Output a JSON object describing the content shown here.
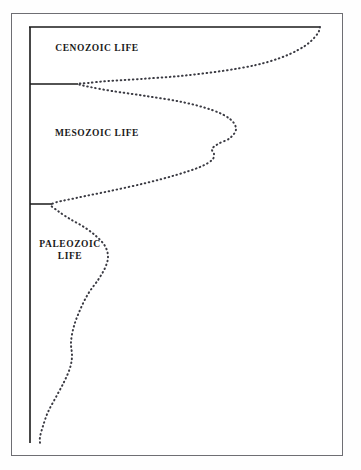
{
  "figure": {
    "title": "",
    "background_color": "#ffffff",
    "frame_color": "#6e6e73",
    "axis_color": "#1a1a1a",
    "curve_color": "#3a3a42",
    "curve_style": "dotted"
  },
  "labels": {
    "cenozoic": "CENOZOIC LIFE",
    "mesozoic": "MESOZOIC LIFE",
    "paleozoic": "PALEOZOIC\nLIFE"
  },
  "chart_data": {
    "type": "area",
    "title": "",
    "subtitle": "",
    "xlabel": "",
    "ylabel": "",
    "grid": false,
    "legend_position": "none",
    "orientation": "vertical-spindle",
    "axis": {
      "left_axis_x": 30,
      "left_axis_y_top": 27,
      "left_axis_y_bottom": 443,
      "top_axis_y": 27,
      "top_axis_x_start": 30,
      "top_axis_x_end": 320
    },
    "era_boundaries": [
      {
        "name": "CENOZOIC LIFE",
        "top_y": 27,
        "bottom_y": 84,
        "boundary_tick_x_end": 78
      },
      {
        "name": "MESOZOIC LIFE",
        "top_y": 84,
        "bottom_y": 204,
        "boundary_tick_x_end": 52
      },
      {
        "name": "PALEOZOIC LIFE",
        "top_y": 204,
        "bottom_y": 443,
        "boundary_tick_x_end": 40
      }
    ],
    "series": [
      {
        "name": "diversity outline",
        "points": [
          {
            "x": 320,
            "y": 27
          },
          {
            "x": 318,
            "y": 33
          },
          {
            "x": 310,
            "y": 42
          },
          {
            "x": 298,
            "y": 50
          },
          {
            "x": 280,
            "y": 58
          },
          {
            "x": 256,
            "y": 65
          },
          {
            "x": 222,
            "y": 71
          },
          {
            "x": 180,
            "y": 76
          },
          {
            "x": 140,
            "y": 79
          },
          {
            "x": 108,
            "y": 81
          },
          {
            "x": 88,
            "y": 83
          },
          {
            "x": 78,
            "y": 84
          },
          {
            "x": 90,
            "y": 87
          },
          {
            "x": 112,
            "y": 91
          },
          {
            "x": 146,
            "y": 96
          },
          {
            "x": 182,
            "y": 102
          },
          {
            "x": 212,
            "y": 110
          },
          {
            "x": 230,
            "y": 119
          },
          {
            "x": 236,
            "y": 129
          },
          {
            "x": 230,
            "y": 138
          },
          {
            "x": 218,
            "y": 144
          },
          {
            "x": 212,
            "y": 149
          },
          {
            "x": 214,
            "y": 154
          },
          {
            "x": 212,
            "y": 160
          },
          {
            "x": 200,
            "y": 167
          },
          {
            "x": 176,
            "y": 175
          },
          {
            "x": 146,
            "y": 183
          },
          {
            "x": 110,
            "y": 191
          },
          {
            "x": 76,
            "y": 198
          },
          {
            "x": 52,
            "y": 204
          },
          {
            "x": 58,
            "y": 211
          },
          {
            "x": 70,
            "y": 219
          },
          {
            "x": 84,
            "y": 227
          },
          {
            "x": 96,
            "y": 236
          },
          {
            "x": 105,
            "y": 246
          },
          {
            "x": 108,
            "y": 257
          },
          {
            "x": 105,
            "y": 268
          },
          {
            "x": 98,
            "y": 280
          },
          {
            "x": 88,
            "y": 294
          },
          {
            "x": 80,
            "y": 310
          },
          {
            "x": 74,
            "y": 326
          },
          {
            "x": 71,
            "y": 342
          },
          {
            "x": 72,
            "y": 356
          },
          {
            "x": 70,
            "y": 368
          },
          {
            "x": 64,
            "y": 382
          },
          {
            "x": 56,
            "y": 397
          },
          {
            "x": 48,
            "y": 412
          },
          {
            "x": 43,
            "y": 426
          },
          {
            "x": 40,
            "y": 437
          },
          {
            "x": 40,
            "y": 443
          }
        ]
      }
    ],
    "xlim": [
      30,
      320
    ],
    "ylim": [
      27,
      443
    ]
  }
}
